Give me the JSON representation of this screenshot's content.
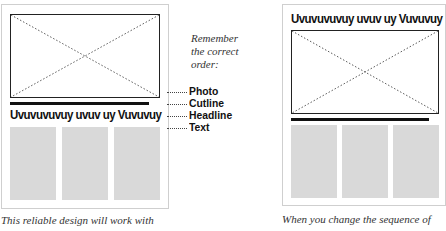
{
  "left_layout": {
    "headline": "Uvuvuvuvuy uvuv uy Vuvuvuy",
    "caption": "This reliable design will work with"
  },
  "right_layout": {
    "headline": "Uvuvuvuvuy uvuv uy Vuvuvuy",
    "caption": "When you change the sequence of"
  },
  "reminder": {
    "text": "Remember the correct order:",
    "items": [
      "Photo",
      "Cutline",
      "Headline",
      "Text"
    ]
  }
}
